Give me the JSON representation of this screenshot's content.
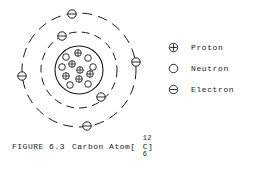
{
  "figure": {
    "background_color": "#ffffff",
    "ink_color": "#1a1a1a",
    "caption_prefix": "FIGURE 6.3",
    "caption_title": "Carbon Atom[",
    "caption_element": "C",
    "caption_mass_number": "12",
    "caption_atomic_number": "6",
    "caption_suffix": "]"
  },
  "legend": {
    "items": [
      {
        "glyph": "circle-plus-icon",
        "label": "Proton"
      },
      {
        "glyph": "circle-open-icon",
        "label": "Neutron"
      },
      {
        "glyph": "circle-minus-icon",
        "label": "Electron"
      }
    ]
  },
  "chart_data": {
    "type": "diagram",
    "model": "bohr-atom",
    "element_symbol": "C",
    "mass_number": 12,
    "atomic_number": 6,
    "proton_count": 6,
    "neutron_count": 6,
    "electron_count": 6,
    "nucleus": {
      "center_x": 79,
      "center_y": 70,
      "radius": 24,
      "stroke_width": 1.1,
      "particles": [
        {
          "type": "proton",
          "x": 78,
          "y": 53,
          "r": 3.3
        },
        {
          "type": "neutron",
          "x": 66,
          "y": 57,
          "r": 3.3
        },
        {
          "type": "neutron",
          "x": 88,
          "y": 58,
          "r": 3.3
        },
        {
          "type": "proton",
          "x": 72,
          "y": 64,
          "r": 3.3
        },
        {
          "type": "neutron",
          "x": 62,
          "y": 67,
          "r": 3.3
        },
        {
          "type": "neutron",
          "x": 93,
          "y": 67,
          "r": 3.3
        },
        {
          "type": "proton",
          "x": 80,
          "y": 70,
          "r": 3.3
        },
        {
          "type": "proton",
          "x": 90,
          "y": 74,
          "r": 3.3
        },
        {
          "type": "proton",
          "x": 66,
          "y": 76,
          "r": 3.3
        },
        {
          "type": "proton",
          "x": 79,
          "y": 79,
          "r": 3.3
        },
        {
          "type": "neutron",
          "x": 70,
          "y": 85,
          "r": 3.3
        },
        {
          "type": "neutron",
          "x": 88,
          "y": 84,
          "r": 3.3
        }
      ]
    },
    "orbits": [
      {
        "name": "inner-shell",
        "shell_index": 1,
        "radius": 38,
        "dashed": true,
        "dash_pattern": "7 6",
        "electron_count": 2,
        "electrons": [
          {
            "angle_deg": 117,
            "x": 62,
            "y": 36
          },
          {
            "angle_deg": -55,
            "x": 101,
            "y": 97
          }
        ]
      },
      {
        "name": "outer-shell",
        "shell_index": 2,
        "radius": 57,
        "dashed": true,
        "dash_pattern": "9 7",
        "electron_count": 4,
        "electrons": [
          {
            "angle_deg": 97,
            "x": 72,
            "y": 14
          },
          {
            "angle_deg": 8,
            "x": 136,
            "y": 62
          },
          {
            "angle_deg": 186,
            "x": 22,
            "y": 76
          },
          {
            "angle_deg": -82,
            "x": 87,
            "y": 126
          }
        ]
      }
    ],
    "legend_position": "right"
  }
}
